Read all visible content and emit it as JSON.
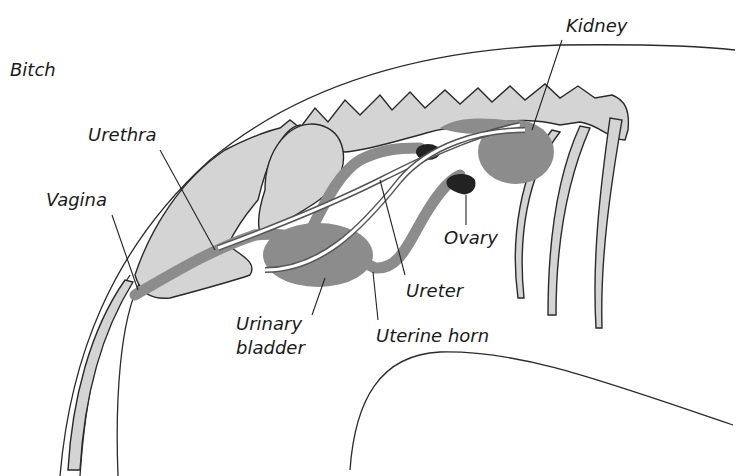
{
  "figure": {
    "title": "Bitch",
    "background": "#ffffff",
    "colors": {
      "spine_fill": "#d4d4d4",
      "organ_fill": "#8c8c8c",
      "ovary_fill": "#222222",
      "outline": "#2a2a2a"
    }
  },
  "labels": {
    "species": "Bitch",
    "kidney": "Kidney",
    "urethra": "Urethra",
    "vagina": "Vagina",
    "ovary": "Ovary",
    "ureter": "Ureter",
    "urinary_bladder_line1": "Urinary",
    "urinary_bladder_line2": "bladder",
    "uterine_horn": "Uterine horn"
  }
}
